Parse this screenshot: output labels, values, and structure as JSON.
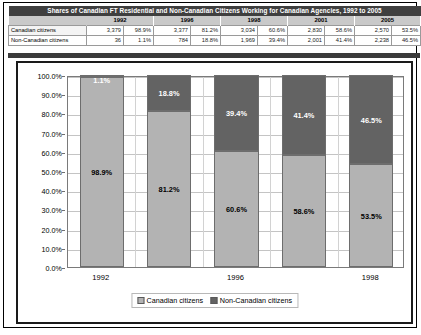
{
  "table": {
    "title": "Shares of Canadian FT Residential and Non-Canadian Citizens Working for Canadian Agencies, 1992 to 2005",
    "year_headers": [
      "1992",
      "1996",
      "1998",
      "2001",
      "2005"
    ],
    "rows": [
      {
        "label": "Canadian citizens",
        "counts": [
          "3,379",
          "3,377",
          "3,034",
          "2,830",
          "2,570"
        ],
        "shares": [
          "98.9%",
          "81.2%",
          "60.6%",
          "58.6%",
          "53.5%"
        ]
      },
      {
        "label": "Non-Canadian citizens",
        "counts": [
          "36",
          "784",
          "1,969",
          "2,001",
          "2,238"
        ],
        "shares": [
          "1.1%",
          "18.8%",
          "39.4%",
          "41.4%",
          "46.5%"
        ]
      }
    ]
  },
  "chart_data": {
    "type": "bar",
    "subtype": "stacked-100-percent",
    "title": "",
    "xlabel": "",
    "ylabel": "",
    "categories": [
      "1992",
      "1996",
      "1998",
      "2001",
      "2005"
    ],
    "visible_tick_labels": [
      "1992",
      "",
      "1996",
      "",
      "1998"
    ],
    "series": [
      {
        "name": "Canadian citizens",
        "color": "#b3b3b3",
        "values": [
          98.9,
          81.2,
          60.6,
          58.6,
          53.5
        ],
        "labels": [
          "98.9%",
          "81.2%",
          "60.6%",
          "58.6%",
          "53.5%"
        ]
      },
      {
        "name": "Non-Canadian citizens",
        "color": "#636363",
        "values": [
          1.1,
          18.8,
          39.4,
          41.4,
          46.5
        ],
        "labels": [
          "1.1%",
          "18.8%",
          "39.4%",
          "41.4%",
          "46.5%"
        ]
      }
    ],
    "ylim": [
      0,
      100
    ],
    "ytick_labels": [
      "0.0%",
      "10.0%",
      "20.0%",
      "30.0%",
      "40.0%",
      "50.0%",
      "60.0%",
      "70.0%",
      "80.0%",
      "90.0%",
      "100.0%"
    ],
    "ytick_values": [
      0,
      10,
      20,
      30,
      40,
      50,
      60,
      70,
      80,
      90,
      100
    ],
    "grid": true,
    "legend_position": "bottom",
    "legend_entries": [
      "Canadian citizens",
      "Non-Canadian citizens"
    ]
  }
}
